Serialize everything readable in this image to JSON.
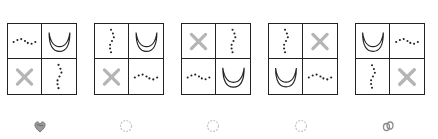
{
  "puzzle": {
    "panels": [
      {
        "id": 1,
        "left": 7,
        "cells": {
          "tl": "dots-horizontal",
          "tr": "crescent",
          "bl": "x-mark",
          "br": "dots-vertical"
        }
      },
      {
        "id": 2,
        "left": 94,
        "cells": {
          "tl": "dots-vertical",
          "tr": "crescent",
          "bl": "x-mark",
          "br": "dots-horizontal"
        }
      },
      {
        "id": 3,
        "left": 181,
        "cells": {
          "tl": "x-mark",
          "tr": "dots-vertical",
          "bl": "dots-horizontal",
          "br": "crescent"
        }
      },
      {
        "id": 4,
        "left": 268,
        "cells": {
          "tl": "dots-vertical",
          "tr": "x-mark",
          "bl": "crescent",
          "br": "dots-horizontal"
        }
      },
      {
        "id": 5,
        "left": 355,
        "cells": {
          "tl": "crescent",
          "tr": "dots-horizontal",
          "bl": "dots-vertical",
          "br": "x-mark"
        }
      }
    ],
    "options": [
      {
        "id": 1,
        "left": 32,
        "icon": "heart-scribble-icon",
        "state": "selected"
      },
      {
        "id": 2,
        "left": 118,
        "icon": "radio-circle-icon",
        "state": "empty"
      },
      {
        "id": 3,
        "left": 205,
        "icon": "radio-circle-icon",
        "state": "empty"
      },
      {
        "id": 4,
        "left": 293,
        "icon": "radio-circle-icon",
        "state": "empty"
      },
      {
        "id": 5,
        "left": 380,
        "icon": "scribble-icon",
        "state": "marked"
      }
    ],
    "colors": {
      "border": "#222222",
      "x_mark": "#b5b5b5",
      "dots": "#222222",
      "crescent": "#222222",
      "option_empty": "#c8c8c8",
      "option_marked": "#8a8a8a"
    }
  }
}
